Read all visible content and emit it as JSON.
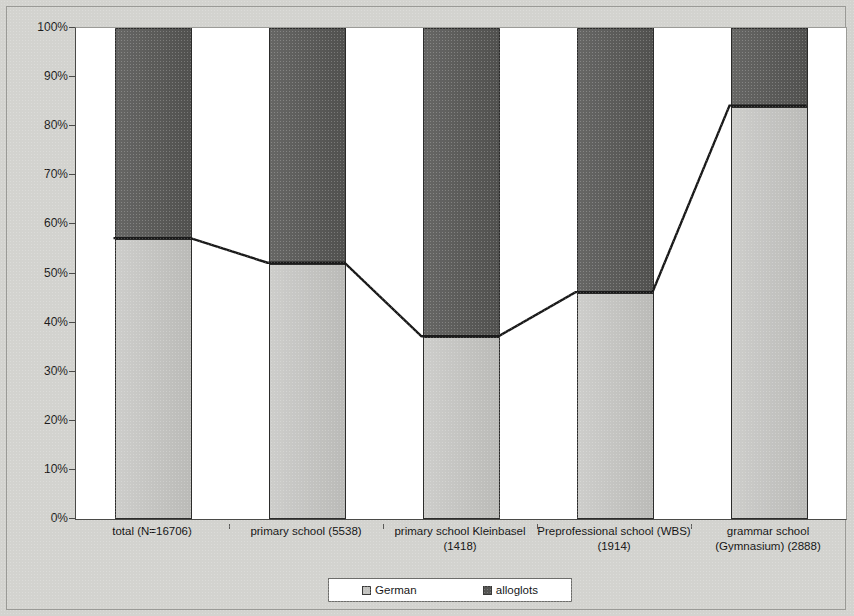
{
  "chart_data": {
    "type": "bar",
    "subtype": "stacked-percentage-with-trend-line",
    "title": "",
    "subtitle": "",
    "xlabel": "",
    "ylabel": "",
    "ylim": [
      0,
      100
    ],
    "grid": false,
    "legend_position": "bottom",
    "y_tick_labels": [
      "100%",
      "90%",
      "80%",
      "70%",
      "60%",
      "50%",
      "40%",
      "30%",
      "20%",
      "10%",
      "0%"
    ],
    "y_tick_values": [
      100,
      90,
      80,
      70,
      60,
      50,
      40,
      30,
      20,
      10,
      0
    ],
    "categories": [
      "total (N=16706)",
      "primary school (5538)",
      "primary school Kleinbasel (1418)",
      "Preprofessional school (WBS) (1914)",
      "grammar school (Gymnasium) (2888)"
    ],
    "series": [
      {
        "name": "German",
        "color": "#c2c2bf",
        "values": [
          57,
          52,
          37,
          46,
          84
        ]
      },
      {
        "name": "alloglots",
        "color": "#555553",
        "values": [
          43,
          48,
          63,
          54,
          16
        ]
      }
    ],
    "trend_line": {
      "name": "German share",
      "color": "#1a1a1a",
      "values": [
        57,
        52,
        37,
        46,
        84
      ]
    }
  },
  "legend": {
    "entries": [
      {
        "label": "German",
        "swatch": "german-swatch"
      },
      {
        "label": "alloglots",
        "swatch": "alloglots-swatch"
      }
    ]
  }
}
